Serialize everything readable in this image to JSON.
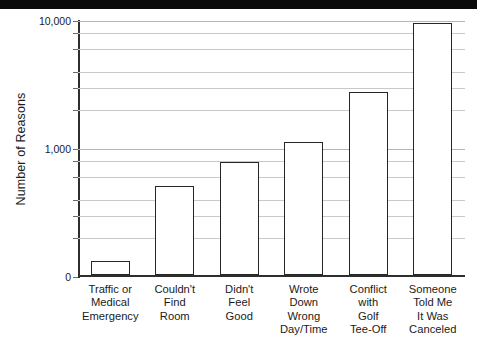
{
  "banner": {
    "name": "top-black-banner",
    "color": "#0a0a0a"
  },
  "chart_data": {
    "type": "bar",
    "title": "",
    "subtitle": "",
    "xlabel": "",
    "ylabel": "Number of Reasons",
    "yscale": "log",
    "ylim": [
      100,
      10000
    ],
    "grid": true,
    "legend_position": "none",
    "bar_color": "#ffffff",
    "bar_edge_color": "#262626",
    "categories": [
      "Traffic or Medical Emergency",
      "Couldn't Find Room",
      "Didn't Feel Good",
      "Wrote Down Wrong Day/Time",
      "Conflict with Golf Tee-Off",
      "Someone Told Me It Was Canceled"
    ],
    "category_lines": [
      [
        "Traffic or",
        "Medical",
        "Emergency"
      ],
      [
        "Couldn't",
        "Find",
        "Room"
      ],
      [
        "Didn't",
        "Feel",
        "Good"
      ],
      [
        "Wrote",
        "Down",
        "Wrong",
        "Day/Time"
      ],
      [
        "Conflict",
        "with",
        "Golf",
        "Tee-Off"
      ],
      [
        "Someone",
        "Told Me",
        "It Was",
        "Canceled"
      ]
    ],
    "values": [
      130,
      500,
      770,
      1100,
      2700,
      9300
    ],
    "ytick_labels": [
      "10,000",
      "1,000",
      "0"
    ],
    "ytick_values": [
      10000,
      1000,
      0
    ],
    "minor_ytick_values": [
      8000,
      6000,
      4000,
      3000,
      2000,
      800,
      600,
      400,
      300,
      200
    ]
  }
}
